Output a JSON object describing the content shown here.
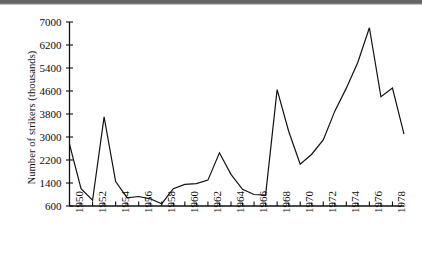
{
  "chart_data": {
    "type": "line",
    "title": "",
    "subtitle": "",
    "xlabel": "",
    "ylabel": "Number of strikers (thousands)",
    "ylim": [
      600,
      7000
    ],
    "xlim": [
      1950,
      1979
    ],
    "ytick_labels": [
      "7000",
      "6200",
      "5400",
      "4600",
      "3800",
      "3000",
      "2200",
      "1400",
      "600"
    ],
    "ytick_values": [
      7000,
      6200,
      5400,
      4600,
      3800,
      3000,
      2200,
      1400,
      600
    ],
    "xtick_labels": [
      "1950",
      "1952",
      "1954",
      "1956",
      "1958",
      "1960",
      "1962",
      "1964",
      "1966",
      "1968",
      "1970",
      "1972",
      "1974",
      "1976",
      "1978"
    ],
    "xtick_values": [
      1950,
      1952,
      1954,
      1956,
      1958,
      1960,
      1962,
      1964,
      1966,
      1968,
      1970,
      1972,
      1974,
      1976,
      1978
    ],
    "minor_xticks": [
      1951,
      1953,
      1955,
      1957,
      1959,
      1961,
      1963,
      1965,
      1967,
      1969,
      1971,
      1973,
      1975,
      1977
    ],
    "grid": false,
    "legend": null,
    "legend_position": "none",
    "line_color": "#111111",
    "line_width": 1.2,
    "x": [
      1950,
      1951,
      1952,
      1953,
      1954,
      1955,
      1956,
      1957,
      1958,
      1959,
      1960,
      1961,
      1962,
      1963,
      1964,
      1965,
      1966,
      1967,
      1968,
      1969,
      1970,
      1971,
      1972,
      1973,
      1974,
      1975,
      1976,
      1977,
      1978,
      1979
    ],
    "values": [
      2750,
      1200,
      800,
      3700,
      1450,
      880,
      930,
      850,
      680,
      1200,
      1350,
      1380,
      1500,
      2450,
      1700,
      1180,
      1000,
      980,
      4650,
      3200,
      2050,
      2400,
      2900,
      3900,
      4700,
      5600,
      6800,
      4400,
      4700,
      3100
    ],
    "series": [
      {
        "name": "Number of strikers",
        "values": [
          2750,
          1200,
          800,
          3700,
          1450,
          880,
          930,
          850,
          680,
          1200,
          1350,
          1380,
          1500,
          2450,
          1700,
          1180,
          1000,
          980,
          4650,
          3200,
          2050,
          2400,
          2900,
          3900,
          4700,
          5600,
          6800,
          4400,
          4700,
          3100
        ]
      }
    ]
  },
  "axes": {
    "y_axis_title": "Number of strikers (thousands)"
  },
  "colors": {
    "line": "#111111",
    "axis": "#111111",
    "text": "#0b0b0b",
    "background": "#ffffff"
  }
}
